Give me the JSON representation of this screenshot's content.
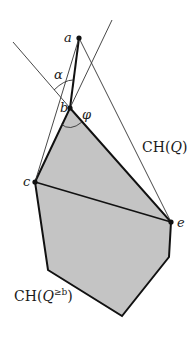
{
  "figure": {
    "type": "geometric-diagram",
    "colors": {
      "region_fill": "#c4c4c4",
      "stroke": "#111111",
      "thin_stroke": "#333333",
      "background": "#ffffff"
    },
    "points": {
      "a": {
        "label": "a",
        "x": 79,
        "y": 38
      },
      "b": {
        "label": "b",
        "x": 70,
        "y": 108
      },
      "c": {
        "label": "c",
        "x": 35,
        "y": 182
      },
      "e": {
        "label": "e",
        "x": 171,
        "y": 222
      }
    },
    "angles": {
      "alpha": {
        "label": "α"
      },
      "phi": {
        "label": "φ"
      }
    },
    "regions": {
      "hull_q": {
        "label_main": "CH(",
        "label_var": "Q",
        "label_close": ")"
      },
      "hull_q_ge_b": {
        "label_main": "CH(",
        "label_var": "Q",
        "label_sup": "≥b",
        "label_close": ")"
      }
    }
  }
}
